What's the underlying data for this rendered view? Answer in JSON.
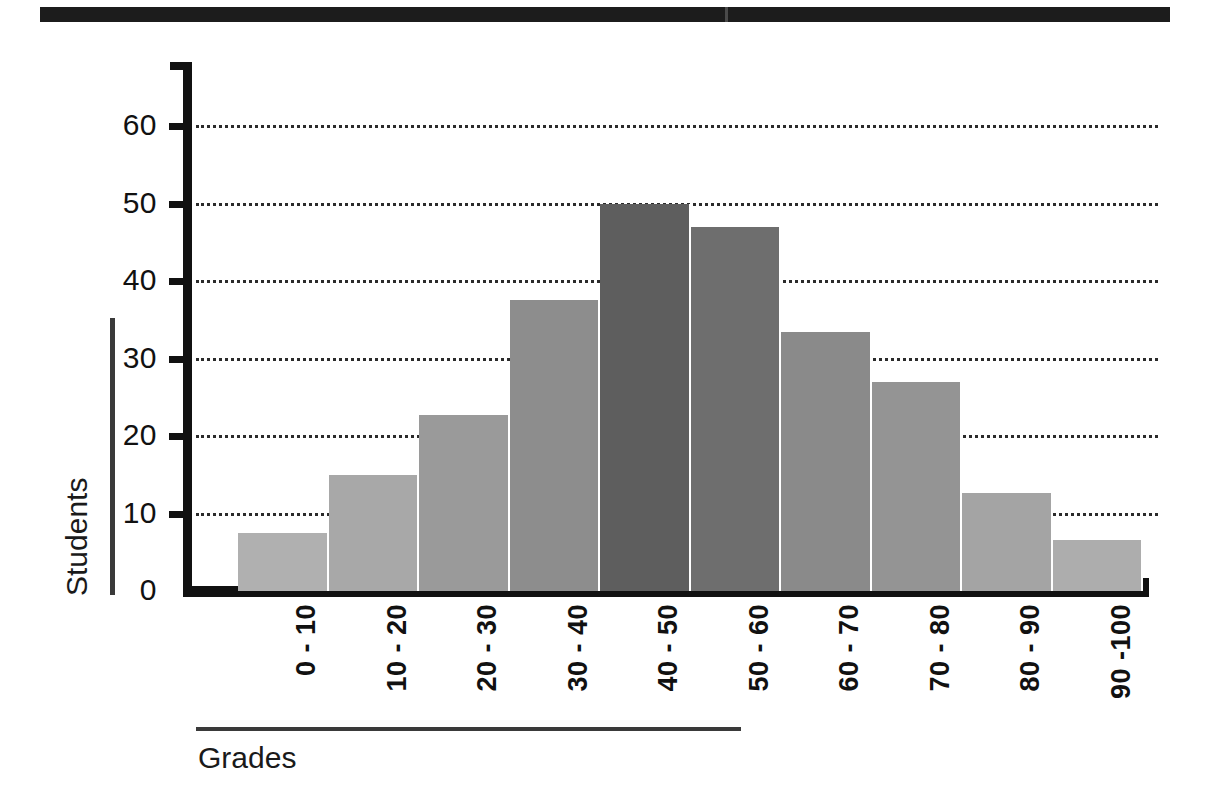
{
  "header": {
    "bar_color": "#1c1c1c"
  },
  "chart_data": {
    "type": "bar",
    "title": "",
    "xlabel": "Grades",
    "ylabel": "Students",
    "categories": [
      "0 - 10",
      "10 - 20",
      "20 - 30",
      "30 - 40",
      "40 - 50",
      "50 - 60",
      "60 - 70",
      "70 - 80",
      "80 - 90",
      "90 -100"
    ],
    "values": [
      7.5,
      15,
      22.7,
      37.5,
      50,
      47,
      33.4,
      27,
      12.6,
      6.6
    ],
    "bar_colors": [
      "#b0b0b0",
      "#a8a8a8",
      "#9a9a9a",
      "#8d8d8d",
      "#5e5e5e",
      "#6e6e6e",
      "#8a8a8a",
      "#949494",
      "#a4a4a4",
      "#adadad"
    ],
    "ylim": [
      0,
      65
    ],
    "yticks": [
      0,
      10,
      20,
      30,
      40,
      50,
      60
    ],
    "ytick_labels": [
      "0",
      "10",
      "20",
      "30",
      "40",
      "50",
      "60"
    ],
    "gridlines": [
      10,
      20,
      30,
      40,
      50,
      60
    ],
    "grid": true,
    "grid_style": "dotted",
    "legend": null,
    "legend_position": "none"
  }
}
